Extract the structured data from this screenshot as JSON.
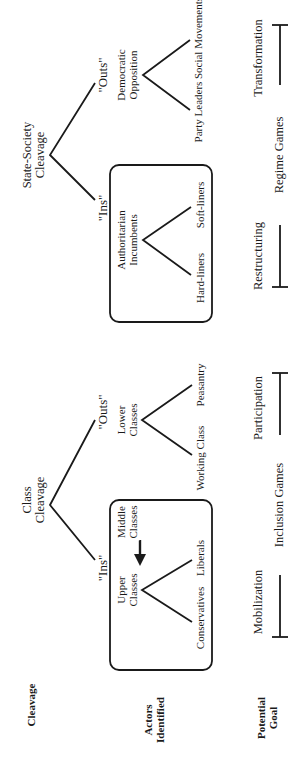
{
  "row_labels": {
    "cleavage": "Cleavage",
    "actors_1": "Actors",
    "actors_2": "Identified",
    "goal_1": "Potential",
    "goal_2": "Goal"
  },
  "class_tree": {
    "root_1": "Class",
    "root_2": "Cleavage",
    "ins": "\"Ins\"",
    "outs": "\"Outs\"",
    "ins_group_1": "Upper",
    "ins_group_2": "Classes",
    "ins_left": "Conservatives",
    "ins_right": "Liberals",
    "middle_1": "Middle",
    "middle_2": "Classes",
    "outs_group_1": "Lower",
    "outs_group_2": "Classes",
    "outs_left": "Working Class",
    "outs_right": "Peasantry"
  },
  "state_tree": {
    "root_1": "State-Society",
    "root_2": "Cleavage",
    "ins": "\"Ins\"",
    "outs": "\"Outs\"",
    "ins_group_1": "Authoritarian",
    "ins_group_2": "Incumbents",
    "ins_left": "Hard-liners",
    "ins_right": "Soft-liners",
    "outs_group_1": "Democratic",
    "outs_group_2": "Opposition",
    "outs_left": "Party Leaders",
    "outs_right": "Social Movements"
  },
  "goals": {
    "inclusion_start": "Mobilization",
    "inclusion_end": "Participation",
    "inclusion_label": "Inclusion Games",
    "regime_start": "Restructuring",
    "regime_end": "Transformation",
    "regime_label": "Regime Games"
  },
  "colors": {
    "line": "#1a1a1a",
    "background": "#ffffff"
  }
}
